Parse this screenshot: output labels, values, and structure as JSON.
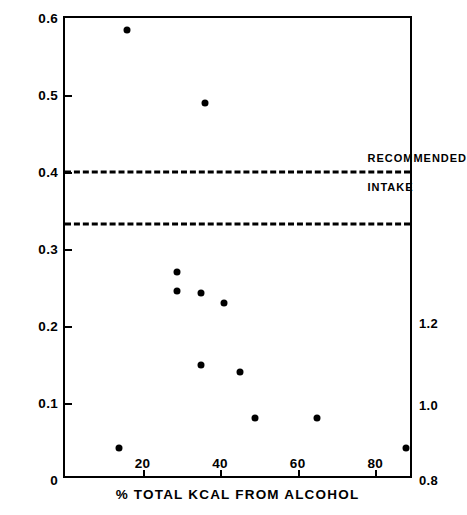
{
  "chart_data": {
    "type": "scatter",
    "title": "",
    "xlabel": "% TOTAL KCAL FROM ALCOHOL",
    "ylabel": "MG THIAMINE /1000 KCAL",
    "xlim": [
      0,
      90
    ],
    "ylim": [
      0,
      0.6
    ],
    "grid": false,
    "legend": "none",
    "x_ticks": [
      "20",
      "40",
      "60",
      "80"
    ],
    "x_tick_values": [
      20,
      40,
      60,
      80
    ],
    "y_ticks": [
      "0",
      "0.1",
      "0.2",
      "0.3",
      "0.4",
      "0.5",
      "0.6"
    ],
    "y_tick_values": [
      0,
      0.1,
      0.2,
      0.3,
      0.4,
      0.5,
      0.6
    ],
    "right_axis": {
      "labels": [
        "0.8",
        "1.0",
        "1.2"
      ],
      "label_values": [
        0.8,
        1.0,
        1.2
      ],
      "positions_in_left_units": [
        0.0,
        0.097,
        0.2035
      ]
    },
    "points": [
      {
        "x": 16,
        "y": 0.585
      },
      {
        "x": 36,
        "y": 0.49
      },
      {
        "x": 29,
        "y": 0.27
      },
      {
        "x": 29,
        "y": 0.245
      },
      {
        "x": 35,
        "y": 0.243
      },
      {
        "x": 41,
        "y": 0.23
      },
      {
        "x": 35,
        "y": 0.15
      },
      {
        "x": 45,
        "y": 0.14
      },
      {
        "x": 49,
        "y": 0.08
      },
      {
        "x": 65,
        "y": 0.08
      },
      {
        "x": 14,
        "y": 0.042
      },
      {
        "x": 88,
        "y": 0.042
      }
    ],
    "reference_lines": [
      {
        "y": 0.4,
        "style": "dashed",
        "label": "RECOMMENDED INTAKE"
      },
      {
        "y": 0.333,
        "style": "dashed",
        "label": ""
      }
    ],
    "annotations": [
      {
        "text": "RECOMMENDED",
        "x": 78,
        "y": 0.418
      },
      {
        "text": "INTAKE",
        "x": 78,
        "y": 0.381
      }
    ]
  },
  "colors": {
    "axis": "#000000",
    "marker": "#000000",
    "background": "#ffffff"
  }
}
